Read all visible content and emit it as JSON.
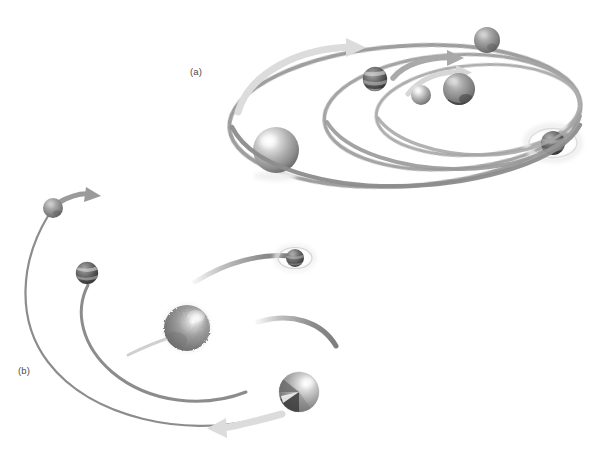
{
  "figure": {
    "background_color": "#ffffff",
    "width": 609,
    "height": 464,
    "panels": [
      {
        "id": "a",
        "label": "(a)",
        "label_x": 190,
        "label_y": 66,
        "description": "Nested elliptical orbits with spheres and directional arrows",
        "orbits": [
          {
            "name": "outer-orbit",
            "cx": 405,
            "cy": 116,
            "rx": 176,
            "ry": 70,
            "rotation": -4,
            "stroke": "#8e8e8e",
            "width": 4
          },
          {
            "name": "middle-orbit",
            "cx": 455,
            "cy": 113,
            "rx": 126,
            "ry": 57,
            "rotation": -4,
            "stroke": "#9a9a9a",
            "width": 3.5
          },
          {
            "name": "inner-orbit",
            "cx": 480,
            "cy": 110,
            "rx": 100,
            "ry": 45,
            "rotation": -4,
            "stroke": "#a8a8a8",
            "width": 3
          }
        ],
        "arrows": [
          {
            "name": "outer-orbit-arrow",
            "tip_x": 362,
            "tip_y": 47,
            "color": "#d8d8d8"
          },
          {
            "name": "middle-orbit-arrow",
            "tip_x": 462,
            "tip_y": 57,
            "color": "#a6a6a6"
          },
          {
            "name": "inner-orbit-arrow",
            "tip_x": 470,
            "tip_y": 72,
            "color": "#d2d2d2"
          }
        ],
        "bodies": [
          {
            "name": "primary-star",
            "cx": 276,
            "cy": 150,
            "r": 23,
            "style": "glossy-gray",
            "highlighted": false
          },
          {
            "name": "banded-planet",
            "cx": 375,
            "cy": 79,
            "r": 12,
            "style": "banded-dark",
            "highlighted": false
          },
          {
            "name": "small-planet",
            "cx": 421,
            "cy": 95,
            "r": 10,
            "style": "glossy-gray",
            "highlighted": false
          },
          {
            "name": "textured-planet",
            "cx": 459,
            "cy": 89,
            "r": 16,
            "style": "textured-dark",
            "highlighted": false
          },
          {
            "name": "upper-planet",
            "cx": 487,
            "cy": 40,
            "r": 13,
            "style": "rocky-gray",
            "highlighted": false
          },
          {
            "name": "halo-planet",
            "cx": 553,
            "cy": 143,
            "r": 12,
            "style": "textured-dark",
            "highlighted": true,
            "halo_rx": 27,
            "halo_ry": 17
          }
        ]
      },
      {
        "id": "b",
        "label": "(b)",
        "label_x": 18,
        "label_y": 365,
        "description": "Open hyperbolic arcs with escaping bodies and directional arrows",
        "orbits": [
          {
            "name": "outer-arc",
            "path": "open-left-sweep",
            "stroke": "#8c8c8c",
            "width": 2.2
          },
          {
            "name": "middle-arc",
            "path": "inner-left-sweep",
            "stroke": "#8c8c8c",
            "width": 3
          },
          {
            "name": "upper-right-arc",
            "path": "incoming-arc",
            "stroke": "#9a9a9a",
            "width": 4
          },
          {
            "name": "lower-right-arc",
            "path": "outgoing-arc",
            "stroke": "#9a9a9a",
            "width": 4
          }
        ],
        "arrows": [
          {
            "name": "escape-arrow-upper-left",
            "tip_x": 98,
            "tip_y": 196,
            "color": "#9b9b9b"
          },
          {
            "name": "escape-arrow-lower",
            "tip_x": 210,
            "tip_y": 428,
            "color": "#d9d9d9"
          }
        ],
        "bodies": [
          {
            "name": "escaping-planet",
            "cx": 53,
            "cy": 208,
            "r": 10,
            "style": "rocky-gray",
            "highlighted": false
          },
          {
            "name": "banded-planet",
            "cx": 87,
            "cy": 273,
            "r": 11,
            "style": "banded-dark",
            "highlighted": false
          },
          {
            "name": "central-star",
            "cx": 187,
            "cy": 328,
            "r": 23,
            "style": "fuzzy-gray",
            "highlighted": false
          },
          {
            "name": "halo-planet",
            "cx": 295,
            "cy": 258,
            "r": 9,
            "style": "textured-dark",
            "highlighted": true,
            "halo_rx": 19,
            "halo_ry": 12
          },
          {
            "name": "quadrant-planet",
            "cx": 299,
            "cy": 392,
            "r": 20,
            "style": "quadrant-gray",
            "highlighted": false
          }
        ]
      }
    ],
    "colors": {
      "background": "#ffffff",
      "orbit_dark": "#8c8c8c",
      "orbit_light": "#c9c9c9",
      "arrow_light": "#d8d8d8",
      "arrow_mid": "#9b9b9b",
      "sphere_light": "#e8e8e8",
      "sphere_mid": "#9a9a9a",
      "sphere_dark": "#3a3a3a",
      "label_text": "#4a4a4a"
    }
  }
}
